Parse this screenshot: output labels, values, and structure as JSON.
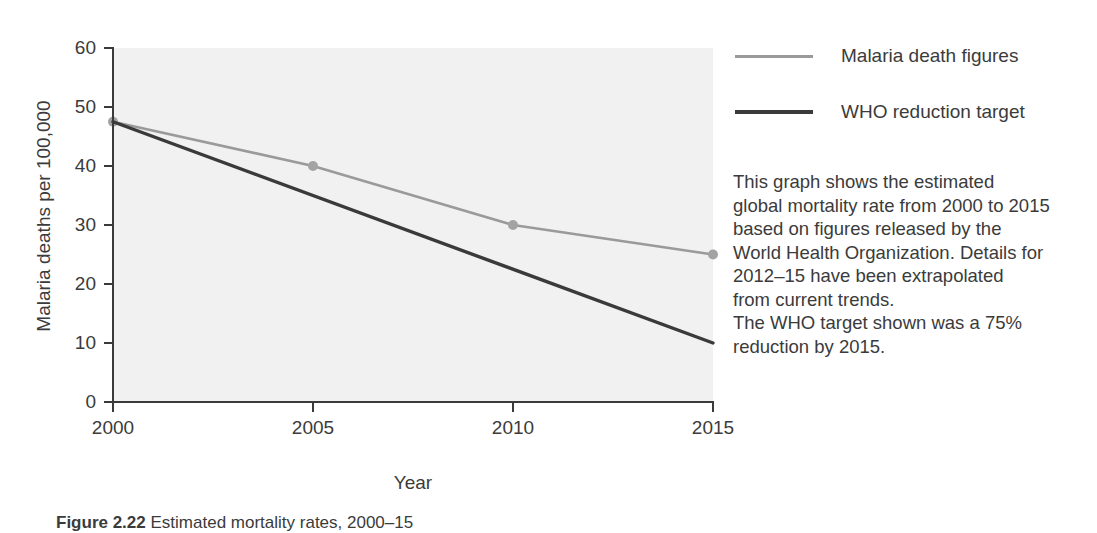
{
  "chart_data": {
    "type": "line",
    "title": "",
    "xlabel": "Year",
    "ylabel": "Malaria deaths per 100,000",
    "x": [
      2000,
      2005,
      2010,
      2015
    ],
    "xticklabels": [
      "2000",
      "2005",
      "2010",
      "2015"
    ],
    "yticklabels": [
      "0",
      "10",
      "20",
      "30",
      "40",
      "50",
      "60"
    ],
    "yticks": [
      0,
      10,
      20,
      30,
      40,
      50,
      60
    ],
    "xlim": [
      2000,
      2015
    ],
    "ylim": [
      0,
      60
    ],
    "grid": false,
    "legend_position": "right",
    "series": [
      {
        "name": "Malaria death figures",
        "color": "#9a9a9a",
        "markers": true,
        "marker_color": "#a3a3a3",
        "x": [
          2000,
          2005,
          2010,
          2015
        ],
        "values": [
          47.5,
          40,
          30,
          25
        ]
      },
      {
        "name": "WHO reduction target",
        "color": "#3a3a3a",
        "markers": false,
        "x": [
          2000,
          2015
        ],
        "values": [
          47.5,
          10
        ]
      }
    ]
  },
  "legend": {
    "items": [
      {
        "label": "Malaria death figures"
      },
      {
        "label": "WHO reduction target"
      }
    ]
  },
  "description": {
    "lines": [
      "This graph shows the estimated",
      "global mortality rate from 2000 to 2015",
      "based on figures released by the",
      "World Health Organization. Details for",
      "2012–15 have been extrapolated",
      "from current trends.",
      "The WHO target shown was a 75%",
      "reduction by 2015."
    ]
  },
  "caption": {
    "label": "Figure 2.22",
    "text": "Estimated mortality rates, 2000–15"
  },
  "colors": {
    "plot_background": "#f1f1f1",
    "axis": "#3a3a3a",
    "series_a": "#9a9a9a",
    "series_b": "#3a3a3a",
    "text": "#3b3b3b"
  }
}
